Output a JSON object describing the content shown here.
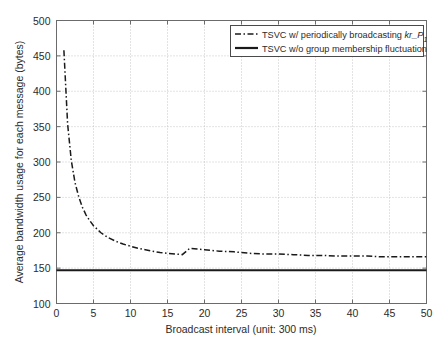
{
  "chart_data": {
    "type": "line",
    "title": "",
    "xlabel": "Broadcast interval (unit: 300 ms)",
    "ylabel": "Average bandwidth usage for each message (bytes)",
    "xlim": [
      0,
      50
    ],
    "ylim": [
      100,
      500
    ],
    "xticks": [
      0,
      5,
      10,
      15,
      20,
      25,
      30,
      35,
      40,
      45,
      50
    ],
    "yticks": [
      100,
      150,
      200,
      250,
      300,
      350,
      400,
      450,
      500
    ],
    "grid": true,
    "legend_position": "top-right",
    "series": [
      {
        "name": "TSVC w/ periodically broadcasting kr_P1",
        "style": "dash-dot",
        "color": "#1a1a1a",
        "x": [
          1,
          1.5,
          2,
          2.5,
          3,
          3.5,
          4,
          4.5,
          5,
          6,
          7,
          8,
          9,
          10,
          11,
          12,
          13,
          14,
          15,
          16,
          17,
          18,
          19,
          20,
          22,
          24,
          26,
          28,
          30,
          32,
          34,
          36,
          38,
          40,
          42,
          44,
          46,
          48,
          50
        ],
        "y": [
          458,
          354,
          302,
          271,
          251,
          236,
          225,
          217,
          210,
          200,
          193,
          188,
          184,
          181,
          178,
          176,
          174,
          172,
          171,
          170,
          169,
          178,
          177,
          176,
          174,
          173,
          171,
          170,
          170,
          169,
          168,
          168,
          167,
          167,
          167,
          166,
          166,
          166,
          166
        ]
      },
      {
        "name": "TSVC w/o group membership fluctuation",
        "style": "solid",
        "color": "#1a1a1a",
        "x": [
          0,
          50
        ],
        "y": [
          147,
          147
        ]
      }
    ]
  },
  "legend": {
    "entries": [
      {
        "label_pre": "TSVC w/ periodically broadcasting ",
        "label_italic": "kr_P",
        "label_sub": "1",
        "sample": "dash-dot"
      },
      {
        "label_pre": "TSVC w/o group membership fluctuation",
        "label_italic": "",
        "label_sub": "",
        "sample": "solid"
      }
    ]
  },
  "caption": {
    "text": ""
  },
  "colors": {
    "axis": "#6b6b6b",
    "grid": "#b9b9b9",
    "line": "#1a1a1a",
    "background": "#ffffff",
    "text": "#2b2b2b"
  }
}
